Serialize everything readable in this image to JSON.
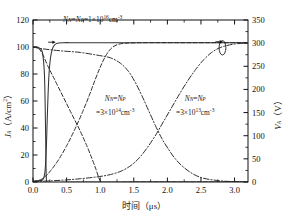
{
  "chart_data": {
    "type": "line",
    "title": "",
    "xlabel": "时间（μs）",
    "ylabel": "J_A（A/cm²）",
    "y2label": "V_A（V）",
    "xlim": [
      0.0,
      3.2
    ],
    "ylim": [
      0,
      120
    ],
    "y2lim": [
      0,
      350
    ],
    "xticks": [
      0.0,
      0.5,
      1.0,
      1.5,
      2.0,
      2.5,
      3.0
    ],
    "xticklabels": [
      "0.0",
      "0.5",
      "1.0",
      "1.5",
      "2.0",
      "2.5",
      "3.0"
    ],
    "yticks": [
      0,
      20,
      40,
      60,
      80,
      100,
      120
    ],
    "yticklabels": [
      "0",
      "20",
      "40",
      "60",
      "80",
      "100",
      "120"
    ],
    "y2ticks": [
      0,
      50,
      100,
      150,
      200,
      250,
      300,
      350
    ],
    "y2ticklabels": [
      "0",
      "50",
      "100",
      "150",
      "200",
      "250",
      "300",
      "350"
    ],
    "grid": false,
    "legend": "none",
    "minor_ticks": true,
    "series": [
      {
        "name": "J_A, N_N=N_P=1×10^16 cm^-3",
        "axis": "left",
        "style": "solid",
        "color": "#333333",
        "points": [
          [
            0.0,
            100
          ],
          [
            0.05,
            100
          ],
          [
            0.1,
            99
          ],
          [
            0.14,
            96
          ],
          [
            0.17,
            80
          ],
          [
            0.185,
            45
          ],
          [
            0.195,
            8
          ],
          [
            0.2,
            0
          ],
          [
            0.205,
            -20
          ],
          [
            0.212,
            -45
          ],
          [
            0.218,
            -62
          ],
          [
            0.223,
            -70
          ],
          [
            0.228,
            -62
          ],
          [
            0.235,
            -42
          ],
          [
            0.245,
            -22
          ],
          [
            0.258,
            -10
          ],
          [
            0.275,
            -4
          ],
          [
            0.3,
            -1.5
          ],
          [
            0.35,
            -0.6
          ],
          [
            0.45,
            -0.2
          ],
          [
            0.6,
            0
          ],
          [
            1.0,
            0
          ],
          [
            2.0,
            0
          ],
          [
            3.2,
            0
          ]
        ]
      },
      {
        "name": "V_A, N_N=N_P=1×10^16 cm^-3",
        "axis": "right",
        "style": "solid",
        "color": "#333333",
        "points": [
          [
            0.0,
            2
          ],
          [
            0.1,
            3
          ],
          [
            0.15,
            6
          ],
          [
            0.18,
            25
          ],
          [
            0.2,
            80
          ],
          [
            0.215,
            150
          ],
          [
            0.235,
            225
          ],
          [
            0.26,
            268
          ],
          [
            0.29,
            288
          ],
          [
            0.32,
            296
          ],
          [
            0.36,
            300
          ],
          [
            0.45,
            301
          ],
          [
            0.7,
            301
          ],
          [
            1.5,
            301
          ],
          [
            2.5,
            301
          ],
          [
            3.2,
            301
          ]
        ]
      },
      {
        "name": "J_A, N_N=N_P=3×10^14 cm^-3",
        "axis": "left",
        "style": "dashed",
        "color": "#222222",
        "points": [
          [
            0.0,
            100
          ],
          [
            0.08,
            99
          ],
          [
            0.14,
            95
          ],
          [
            0.22,
            86
          ],
          [
            0.32,
            76
          ],
          [
            0.45,
            63
          ],
          [
            0.58,
            50
          ],
          [
            0.7,
            38
          ],
          [
            0.8,
            27
          ],
          [
            0.88,
            17
          ],
          [
            0.94,
            9
          ],
          [
            0.98,
            3
          ],
          [
            1.01,
            0
          ],
          [
            1.03,
            -3
          ],
          [
            1.06,
            -4
          ],
          [
            1.1,
            -3
          ],
          [
            1.15,
            -1.5
          ],
          [
            1.22,
            -0.6
          ],
          [
            1.35,
            -0.2
          ],
          [
            1.6,
            0
          ],
          [
            2.2,
            0
          ],
          [
            3.2,
            0
          ]
        ]
      },
      {
        "name": "V_A, N_N=N_P=3×10^14 cm^-3",
        "axis": "right",
        "style": "dashed",
        "color": "#222222",
        "points": [
          [
            0.0,
            1
          ],
          [
            0.08,
            3
          ],
          [
            0.16,
            9
          ],
          [
            0.26,
            24
          ],
          [
            0.38,
            48
          ],
          [
            0.5,
            78
          ],
          [
            0.62,
            113
          ],
          [
            0.74,
            152
          ],
          [
            0.84,
            188
          ],
          [
            0.92,
            219
          ],
          [
            1.0,
            248
          ],
          [
            1.08,
            272
          ],
          [
            1.16,
            288
          ],
          [
            1.26,
            297
          ],
          [
            1.4,
            300
          ],
          [
            1.7,
            301
          ],
          [
            2.3,
            301
          ],
          [
            3.2,
            301
          ]
        ]
      },
      {
        "name": "J_A, N_N=N_P=3×10^13 cm^-3",
        "axis": "left",
        "style": "dashdot",
        "color": "#222222",
        "points": [
          [
            0.0,
            100
          ],
          [
            0.1,
            99
          ],
          [
            0.25,
            98
          ],
          [
            0.45,
            97
          ],
          [
            0.7,
            96
          ],
          [
            0.95,
            94
          ],
          [
            1.15,
            92
          ],
          [
            1.3,
            88
          ],
          [
            1.42,
            82
          ],
          [
            1.52,
            74
          ],
          [
            1.62,
            64
          ],
          [
            1.72,
            53
          ],
          [
            1.82,
            42
          ],
          [
            1.92,
            32
          ],
          [
            2.02,
            24
          ],
          [
            2.12,
            17
          ],
          [
            2.24,
            11
          ],
          [
            2.38,
            6
          ],
          [
            2.52,
            3
          ],
          [
            2.68,
            1.5
          ],
          [
            2.85,
            0.6
          ],
          [
            3.05,
            0.2
          ],
          [
            3.2,
            0
          ]
        ]
      },
      {
        "name": "V_A, N_N=N_P=3×10^13 cm^-3",
        "axis": "right",
        "style": "dashdot",
        "color": "#222222",
        "points": [
          [
            0.0,
            1
          ],
          [
            0.2,
            2
          ],
          [
            0.45,
            4
          ],
          [
            0.7,
            7
          ],
          [
            0.95,
            11
          ],
          [
            1.15,
            16
          ],
          [
            1.32,
            24
          ],
          [
            1.46,
            36
          ],
          [
            1.58,
            52
          ],
          [
            1.7,
            74
          ],
          [
            1.82,
            100
          ],
          [
            1.94,
            130
          ],
          [
            2.06,
            160
          ],
          [
            2.18,
            190
          ],
          [
            2.3,
            218
          ],
          [
            2.42,
            243
          ],
          [
            2.54,
            264
          ],
          [
            2.66,
            280
          ],
          [
            2.78,
            290
          ],
          [
            2.92,
            296
          ],
          [
            3.05,
            299
          ],
          [
            3.2,
            300
          ]
        ]
      }
    ],
    "annotations": [
      {
        "id": "ann-top",
        "text": "N_N=N_P=1×10^16cm^-3",
        "x": 1.05,
        "y_frac": 0.93
      },
      {
        "id": "ann-mid",
        "text": "N_N=N_P =3×10^14cm^-3",
        "x": 1.4,
        "y_frac": 0.45
      },
      {
        "id": "ann-right",
        "text": "N_N=N_P =3×10^13cm^-3",
        "x": 2.3,
        "y_frac": 0.45
      }
    ],
    "annotation_parts": {
      "top": {
        "n_sub1": "N",
        "s1": "N",
        "eq1": "=",
        "n_sub2": "N",
        "s2": "P",
        "eq2": "=1×10",
        "exp": "16",
        "unit": "cm",
        "unit_exp": "-3"
      },
      "mid_line1": {
        "n1": "N",
        "s1": "N",
        "eq": "=",
        "n2": "N",
        "s2": "P"
      },
      "mid_line2": {
        "val": "=3×10",
        "exp": "14",
        "unit": "cm",
        "unit_exp": "-3"
      },
      "right_line1": {
        "n1": "N",
        "s1": "N",
        "eq": "=",
        "n2": "N",
        "s2": "P"
      },
      "right_line2": {
        "val": "=3×10",
        "exp": "13",
        "unit": "cm",
        "unit_exp": "-3"
      }
    },
    "axis_label_parts": {
      "left_var": "J",
      "left_sub": "A",
      "left_unit": "（A/cm",
      "left_unit_exp": "2",
      "left_unit_close": "）",
      "right_var": "V",
      "right_sub": "A",
      "right_unit": "（V）",
      "x_text": "时间（μs）"
    },
    "markers": [
      {
        "id": "arrow-left",
        "x": 0.33,
        "y2": 302,
        "dir": "right"
      },
      {
        "id": "arrow-right",
        "x": 2.82,
        "y2": 303,
        "dir": "right"
      },
      {
        "id": "loop-right",
        "x": 2.82,
        "y2": 290
      }
    ]
  }
}
